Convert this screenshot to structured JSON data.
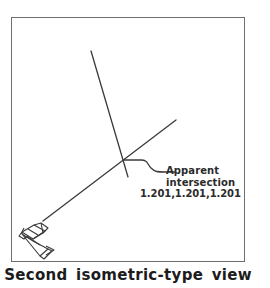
{
  "figure": {
    "caption": "Second isometric-type view",
    "frame": {
      "name": "drawing-viewport",
      "border_color": "#6e6e6e"
    },
    "line_color": "#3a3a3a",
    "text_color": "#2b2b2b"
  },
  "annotation": {
    "label_line_1": "Apparent",
    "label_line_2": "intersection",
    "coordinates": "1.201,1.201,1.201",
    "leader_name": "leader-line"
  },
  "geometry": {
    "steep_line": {
      "name": "steep-3d-line",
      "x1": 91,
      "y1": 51,
      "x2": 128,
      "y2": 177
    },
    "diagonal_line": {
      "name": "diagonal-3d-line",
      "x1": 43,
      "y1": 221,
      "x2": 176,
      "y2": 120
    },
    "apparent_intersection_point": {
      "name": "apparent-intersection-marker",
      "x": 124,
      "y": 160
    },
    "leader_path": "M 124 160 L 141 160 L 148 161 L 152 165 L 157 170 L 161 172 L 175 172",
    "ucs_icon": {
      "name": "ucs-isometric-icon",
      "origin_x": 22,
      "origin_y": 230
    }
  },
  "chart_data": {
    "type": "line",
    "title": "Second isometric-type view",
    "xlabel": "",
    "ylabel": "",
    "annotations": [
      {
        "text": "Apparent intersection",
        "value": "1.201,1.201,1.201",
        "x": 124,
        "y": 160
      }
    ],
    "series": [
      {
        "name": "steep-3d-line",
        "x": [
          91,
          128
        ],
        "y": [
          51,
          177
        ]
      },
      {
        "name": "diagonal-3d-line",
        "x": [
          43,
          176
        ],
        "y": [
          221,
          120
        ]
      }
    ],
    "legend": "none",
    "grid": false
  }
}
